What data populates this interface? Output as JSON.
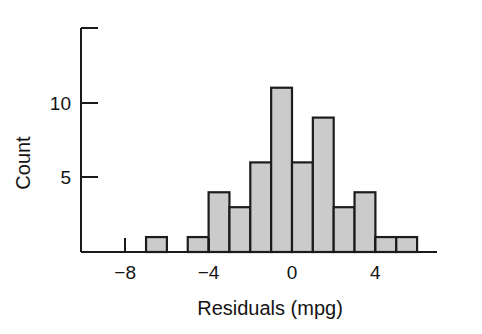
{
  "chart_data": {
    "type": "bar",
    "title": "",
    "subtitle": "",
    "xlabel": "Residuals (mpg)",
    "ylabel": "Count",
    "grid": false,
    "legend": false,
    "legend_position": "none",
    "bin_width": 1,
    "bin_starts": [
      -7,
      -6,
      -5,
      -4,
      -3,
      -2,
      -1,
      0,
      1,
      2,
      3,
      4,
      5
    ],
    "bin_labels": [
      "-7 to -6",
      "-6 to -5",
      "-5 to -4",
      "-4 to -3",
      "-3 to -2",
      "-2 to -1",
      "-1 to 0",
      "0 to 1",
      "1 to 2",
      "2 to 3",
      "3 to 4",
      "4 to 5",
      "5 to 6"
    ],
    "categories": [
      "-6.5",
      "-5.5",
      "-4.5",
      "-3.5",
      "-2.5",
      "-1.5",
      "-0.5",
      "0.5",
      "1.5",
      "2.5",
      "3.5",
      "4.5",
      "5.5"
    ],
    "values": [
      1,
      0,
      1,
      4,
      3,
      6,
      11,
      6,
      9,
      3,
      4,
      1,
      1
    ],
    "total_count": 50,
    "xlim": [
      -9,
      7
    ],
    "ylim": [
      0,
      15
    ],
    "xticks": [
      -8,
      -4,
      0,
      4
    ],
    "xtick_labels": [
      "−8",
      "−4",
      "0",
      "4"
    ],
    "yticks": [
      5,
      10,
      15
    ],
    "ytick_labels": [
      "5",
      "10",
      ""
    ],
    "bar_fill_color": "#cbcbcb",
    "bar_edge_color": "#1c1c1c",
    "axis_color": "#1a1a1a"
  },
  "figure": {
    "caption": ""
  }
}
